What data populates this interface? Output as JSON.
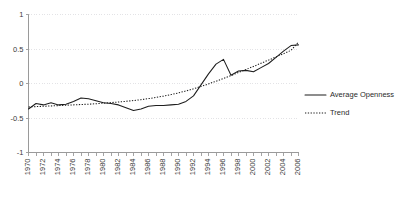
{
  "chart_data": {
    "type": "line",
    "title": "",
    "xlabel": "",
    "ylabel": "",
    "xlim": [
      1970,
      2006
    ],
    "ylim": [
      -1,
      1
    ],
    "grid": true,
    "legend_position": "right",
    "ytick_labels": [
      "1",
      "0.5",
      "0",
      "-0.5",
      "-1"
    ],
    "ytick_values": [
      1,
      0.5,
      0,
      -0.5,
      -1
    ],
    "xtick_labels": [
      "1970",
      "1972",
      "1974",
      "1976",
      "1978",
      "1980",
      "1982",
      "1984",
      "1986",
      "1988",
      "1990",
      "1992",
      "1994",
      "1996",
      "1998",
      "2000",
      "2002",
      "2004",
      "2006"
    ],
    "xtick_values": [
      1970,
      1972,
      1974,
      1976,
      1978,
      1980,
      1982,
      1984,
      1986,
      1988,
      1990,
      1992,
      1994,
      1996,
      1998,
      2000,
      2002,
      2004,
      2006
    ],
    "x": [
      1970,
      1971,
      1972,
      1973,
      1974,
      1975,
      1976,
      1977,
      1978,
      1979,
      1980,
      1981,
      1982,
      1983,
      1984,
      1985,
      1986,
      1987,
      1988,
      1989,
      1990,
      1991,
      1992,
      1993,
      1994,
      1995,
      1996,
      1997,
      1998,
      1999,
      2000,
      2001,
      2002,
      2003,
      2004,
      2005,
      2006
    ],
    "series": [
      {
        "name": "Average Openness",
        "style": "solid",
        "color": "#1d1d1d",
        "values": [
          -0.37,
          -0.29,
          -0.31,
          -0.28,
          -0.31,
          -0.3,
          -0.26,
          -0.21,
          -0.22,
          -0.25,
          -0.28,
          -0.29,
          -0.31,
          -0.35,
          -0.39,
          -0.37,
          -0.33,
          -0.32,
          -0.32,
          -0.31,
          -0.3,
          -0.26,
          -0.18,
          -0.02,
          0.14,
          0.28,
          0.35,
          0.12,
          0.18,
          0.19,
          0.17,
          0.23,
          0.29,
          0.38,
          0.47,
          0.55,
          0.56
        ]
      },
      {
        "name": "Trend",
        "style": "dotted",
        "color": "#1d1d1d",
        "values": [
          -0.34,
          -0.335,
          -0.33,
          -0.325,
          -0.32,
          -0.315,
          -0.31,
          -0.305,
          -0.3,
          -0.293,
          -0.285,
          -0.277,
          -0.268,
          -0.258,
          -0.247,
          -0.234,
          -0.219,
          -0.202,
          -0.183,
          -0.161,
          -0.136,
          -0.108,
          -0.077,
          -0.043,
          -0.006,
          0.033,
          0.074,
          0.116,
          0.159,
          0.203,
          0.248,
          0.293,
          0.339,
          0.385,
          0.432,
          0.48,
          0.6
        ]
      }
    ]
  },
  "legend": {
    "entries": [
      {
        "label": "Average Openness",
        "style": "solid"
      },
      {
        "label": "Trend",
        "style": "dotted"
      }
    ]
  }
}
